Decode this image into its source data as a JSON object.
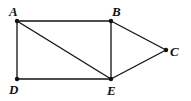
{
  "diagram": {
    "type": "graph",
    "nodes": [
      {
        "id": "A",
        "label": "A",
        "x": 17,
        "y": 21,
        "lx": 9,
        "ly": 16
      },
      {
        "id": "B",
        "label": "B",
        "x": 111,
        "y": 21,
        "lx": 112,
        "ly": 16
      },
      {
        "id": "C",
        "label": "C",
        "x": 166,
        "y": 50,
        "lx": 170,
        "ly": 56
      },
      {
        "id": "D",
        "label": "D",
        "x": 17,
        "y": 79,
        "lx": 9,
        "ly": 94
      },
      {
        "id": "E",
        "label": "E",
        "x": 111,
        "y": 79,
        "lx": 107,
        "ly": 95
      }
    ],
    "edges": [
      [
        "A",
        "B"
      ],
      [
        "A",
        "D"
      ],
      [
        "A",
        "E"
      ],
      [
        "B",
        "E"
      ],
      [
        "B",
        "C"
      ],
      [
        "C",
        "E"
      ],
      [
        "D",
        "E"
      ]
    ],
    "colors": {
      "stroke": "#111111",
      "background": "#ffffff"
    }
  }
}
